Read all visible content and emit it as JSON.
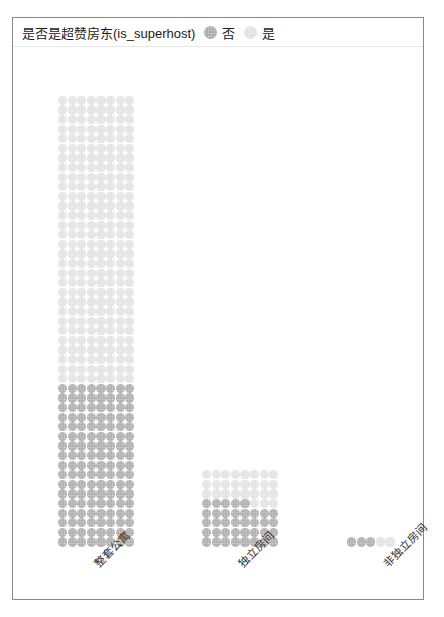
{
  "legend": {
    "title": "是否是超赞房东(is_superhost)",
    "entries": [
      {
        "label": "否",
        "color": "#b0b0b0",
        "icon": "circle-marker-icon"
      },
      {
        "label": "是",
        "color": "#e3e3e3",
        "icon": "circle-marker-icon"
      }
    ]
  },
  "chart_data": {
    "type": "bar",
    "variant": "stacked-dot-matrix",
    "title": "是否是超赞房东(is_superhost)",
    "xlabel": "",
    "ylabel": "",
    "categories": [
      "整套公寓",
      "独立房间",
      "非独立房间"
    ],
    "series": [
      {
        "name": "否",
        "color": "#b0b0b0",
        "values": [
          136,
          37,
          3
        ]
      },
      {
        "name": "是",
        "color": "#e3e3e3",
        "values": [
          240,
          27,
          2
        ]
      }
    ],
    "totals": [
      376,
      64,
      5
    ],
    "dot_unit": "1 dot = 1 listing",
    "columns_per_bar": 8,
    "grid": false,
    "legend_position": "top-left",
    "axis_tick_rotation": -45
  },
  "axis": {
    "tick_labels": [
      "整套公寓",
      "独立房间",
      "非独立房间"
    ]
  }
}
